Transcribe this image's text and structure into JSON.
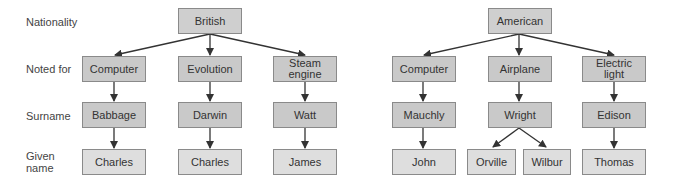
{
  "row_labels": {
    "nationality": "Nationality",
    "noted_for": "Noted for",
    "surname": "Surname",
    "given_name_1": "Given",
    "given_name_2": "name"
  },
  "british": {
    "nationality": "British",
    "columns": [
      {
        "noted_for": "Computer",
        "surname": "Babbage",
        "given": [
          "Charles"
        ]
      },
      {
        "noted_for": "Evolution",
        "surname": "Darwin",
        "given": [
          "Charles"
        ]
      },
      {
        "noted_for_1": "Steam",
        "noted_for_2": "engine",
        "surname": "Watt",
        "given": [
          "James"
        ]
      }
    ]
  },
  "american": {
    "nationality": "American",
    "columns": [
      {
        "noted_for": "Computer",
        "surname": "Mauchly",
        "given": [
          "John"
        ]
      },
      {
        "noted_for": "Airplane",
        "surname": "Wright",
        "given": [
          "Orville",
          "Wilbur"
        ]
      },
      {
        "noted_for_1": "Electric",
        "noted_for_2": "light",
        "surname": "Edison",
        "given": [
          "Thomas"
        ]
      }
    ]
  },
  "colors": {
    "box_border": "#8a8a8a",
    "box_fill_dark": "#c9c9c9",
    "box_fill_light": "#dedede",
    "arrow": "#333333"
  }
}
